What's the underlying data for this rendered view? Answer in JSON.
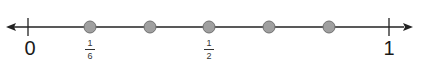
{
  "number_line": {
    "start_label": "0",
    "end_label": "1",
    "line_color": "#222222",
    "dot_color": "#a0a0a0",
    "dot_stroke": "#707070",
    "points": [
      {
        "value": "1/6",
        "labeled": true,
        "num": "1",
        "den": "6"
      },
      {
        "value": "2/6",
        "labeled": false
      },
      {
        "value": "1/2",
        "labeled": true,
        "num": "1",
        "den": "2"
      },
      {
        "value": "4/6",
        "labeled": false
      },
      {
        "value": "5/6",
        "labeled": false
      }
    ]
  }
}
